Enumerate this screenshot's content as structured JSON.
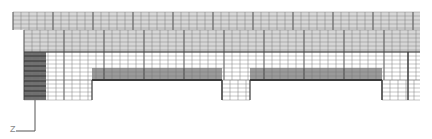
{
  "diagram": {
    "type": "finite-element-mesh",
    "colors": {
      "background": "#ffffff",
      "mesh_fill": "#d6d6d6",
      "mesh_line": "#7a7a7a",
      "mesh_line_bold": "#3a3a3a",
      "band_fill": "#9a9a9a",
      "dark_fill": "#6e6e6e",
      "axis": "#555555"
    },
    "regions": [
      {
        "name": "top-slab",
        "x": 13,
        "y": 12,
        "w": 407,
        "h": 18,
        "fill": "mesh_fill"
      },
      {
        "name": "upper-web",
        "x": 24,
        "y": 30,
        "w": 396,
        "h": 22,
        "fill": "mesh_fill"
      },
      {
        "name": "white-band",
        "x": 24,
        "y": 52,
        "w": 396,
        "h": 28,
        "fill": "background"
      },
      {
        "name": "gray-band-span-1",
        "x": 92,
        "y": 68,
        "w": 130,
        "h": 12,
        "fill": "band_fill"
      },
      {
        "name": "gray-band-span-2",
        "x": 250,
        "y": 68,
        "w": 132,
        "h": 12,
        "fill": "band_fill"
      },
      {
        "name": "left-support-dark",
        "x": 24,
        "y": 52,
        "w": 22,
        "h": 48,
        "fill": "dark_fill"
      },
      {
        "name": "left-support",
        "x": 46,
        "y": 52,
        "w": 46,
        "h": 48,
        "fill": "background"
      },
      {
        "name": "middle-downstand",
        "x": 222,
        "y": 80,
        "w": 28,
        "h": 20,
        "fill": "background"
      },
      {
        "name": "right-downstand",
        "x": 382,
        "y": 80,
        "w": 38,
        "h": 20,
        "fill": "background"
      }
    ],
    "axis": {
      "label": "Z",
      "origin_x": 35,
      "origin_y": 131,
      "vertical_top_y": 100,
      "horizontal_left_x": 16
    }
  }
}
